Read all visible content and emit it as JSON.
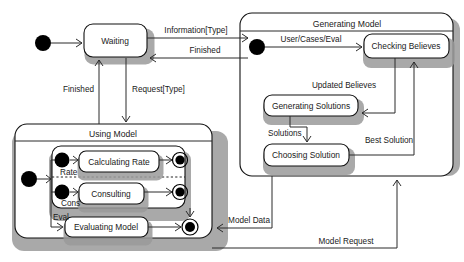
{
  "diagram": {
    "type": "uml-state-machine",
    "colors": {
      "line": "#2b2b2b",
      "fill": "#ffffff",
      "shadow": "#9a9a9a",
      "text": "#1a1a1a"
    }
  },
  "states": {
    "waiting": "Waiting",
    "using_model": "Using Model",
    "calculating_rate": "Calculating Rate",
    "consulting": "Consulting",
    "evaluating_model": "Evaluating Model",
    "generating_model": "Generating Model",
    "checking_believes": "Checking Believes",
    "generating_solutions": "Generating Solutions",
    "choosing_solution": "Choosing Solution"
  },
  "transitions": {
    "information_type": "Information[Type]",
    "finished_right": "Finished",
    "finished_left": "Finished",
    "request_type": "Request[Type]",
    "rate": "Rate",
    "cons": "Cons",
    "eval": "Eval",
    "user_cases_eval": "User/Cases/Eval",
    "updated_believes": "Updated Believes",
    "solutions": "Solutions",
    "best_solution": "Best Solution",
    "model_data": "Model Data",
    "model_request": "Model Request"
  },
  "pseudostates": {
    "initial_top": "initial-state",
    "initial_using_model": "initial-state",
    "initial_rate": "initial-state",
    "initial_cons": "initial-state",
    "initial_generating_model": "initial-state",
    "final_rate": "final-state",
    "final_cons": "final-state",
    "final_using_model": "final-state"
  }
}
